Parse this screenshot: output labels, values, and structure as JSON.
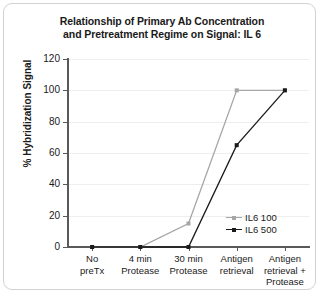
{
  "chart_data": {
    "type": "line",
    "title": "Relationship of Primary Ab Concentration and Pretreatment Regime on Signal: IL 6",
    "title_lines": [
      "Relationship of Primary Ab Concentration",
      "and Pretreatment Regime on Signal: IL 6"
    ],
    "xlabel": "",
    "ylabel": "% Hybridization Signal",
    "ylim": [
      0,
      120
    ],
    "yticks": [
      0,
      20,
      40,
      60,
      80,
      100,
      120
    ],
    "ytick_labels": [
      "0",
      "20",
      "40",
      "60",
      "80",
      "100",
      "120"
    ],
    "grid": "horizontal",
    "legend_position": "inside-lower-right",
    "categories": [
      "No preTx",
      "4 min Protease",
      "30 min Protease",
      "Antigen retrieval",
      "Antigen retrieval + Protease"
    ],
    "category_lines": [
      [
        "No",
        "preTx"
      ],
      [
        "4 min",
        "Protease"
      ],
      [
        "30 min",
        "Protease"
      ],
      [
        "Antigen",
        "retrieval"
      ],
      [
        "Antigen",
        "retrieval +",
        "Protease"
      ]
    ],
    "series": [
      {
        "name": "IL6 100",
        "color": "#a6a6a6",
        "marker": "square",
        "values": [
          0,
          0,
          15,
          100,
          100
        ]
      },
      {
        "name": "IL6 500",
        "color": "#1a1a1a",
        "marker": "square",
        "values": [
          0,
          0,
          0,
          65,
          100
        ]
      }
    ]
  },
  "legend": {
    "entries": [
      {
        "label": "IL6 100"
      },
      {
        "label": "IL6 500"
      }
    ]
  },
  "colors": {
    "axis": "#58595b",
    "grid": "#eeeeee",
    "text": "#1a1a1a",
    "frame": "#d2d2d2",
    "series_light": "#a6a6a6",
    "series_dark": "#1a1a1a"
  }
}
